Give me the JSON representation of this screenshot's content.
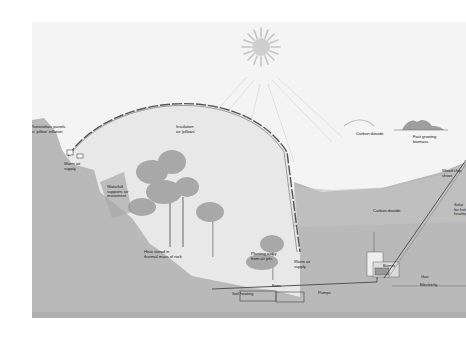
{
  "diagram": {
    "title": "",
    "colors": {
      "sky": "#f4f4f4",
      "ground": "#b9b9b9",
      "ground_dark": "#a8a8a8",
      "dome_interior": "#e6e6e6",
      "dome_pillows": "#555555",
      "sun": "#c9c9c9",
      "vegetation": "#9a9a9a",
      "pipes": "#555555"
    },
    "icons": {
      "sun": "sun-icon",
      "dome": "biodome-icon",
      "trees": "rainforest-trees-icon",
      "burner": "burner-building-icon",
      "biomass": "biomass-crop-icon",
      "solar_panel": "solar-collector-icon"
    },
    "labels": {
      "photovoltaic": "Photovoltaic panels\nfor 'pillow' inflation",
      "insulation": "Insulation\nair 'pillows'",
      "warm_air_supply_left": "Warm air\nsupply",
      "waterfall": "Waterfall\nsupports air\nmovement",
      "heat_stored": "Heat stored in\nthermal mass of rock",
      "planting_away": "Planting away\nfrom air jets",
      "warm_air_supply_right": "Warm air\nsupply",
      "fans": "Fans",
      "soil_heating": "Soil heating",
      "pumps": "Pumps",
      "carbon_dioxide_sky": "Carbon dioxide",
      "fast_growing": "Fast growing\nbiomass",
      "wood_chip": "Wood chip\nshoot",
      "carbon_dioxide_ground": "Carbon dioxide",
      "solar_hot": "Solar\nfor hot\nheating",
      "burner": "Burner",
      "gas": "Gas",
      "electricity": "Electricity"
    }
  }
}
